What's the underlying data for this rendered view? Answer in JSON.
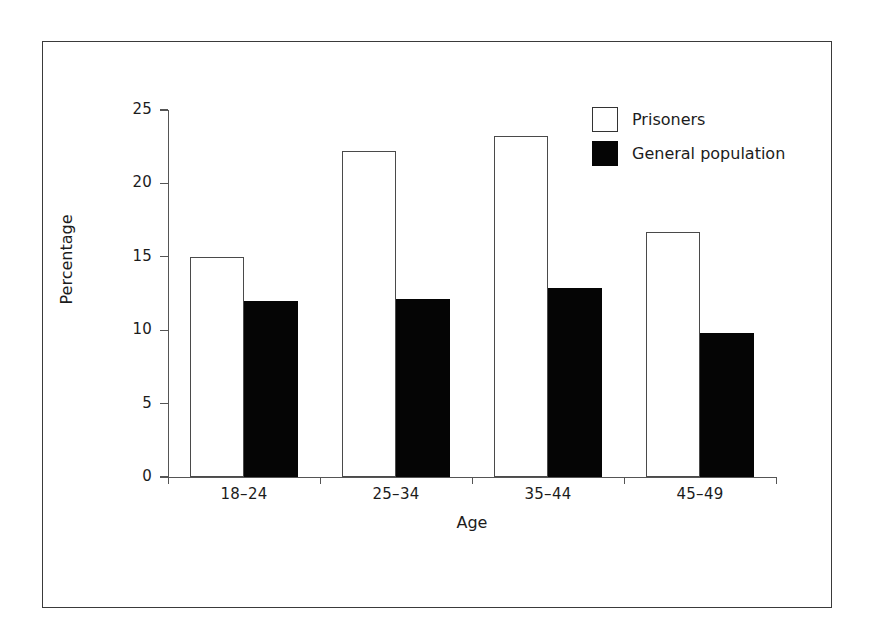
{
  "chart_data": {
    "type": "bar",
    "title": "",
    "subtitle": "",
    "xlabel": "Age",
    "ylabel": "Percentage",
    "categories": [
      "18–24",
      "25–34",
      "35–44",
      "45–49"
    ],
    "series": [
      {
        "name": "Prisoners",
        "values": [
          15.0,
          22.2,
          23.2,
          16.7
        ],
        "color": "#ffffff",
        "edge_color": "#4a4a4a"
      },
      {
        "name": "General population",
        "values": [
          12.0,
          12.1,
          12.9,
          9.8
        ],
        "color": "#050505",
        "edge_color": "#050505"
      }
    ],
    "ylim": [
      0,
      25
    ],
    "yticks": [
      0,
      5,
      10,
      15,
      20,
      25
    ],
    "ytick_labels": [
      "0",
      "5",
      "10",
      "15",
      "20",
      "25"
    ],
    "grid": false,
    "legend_position": "top-right",
    "orientation": "vertical",
    "bar_grouping": "grouped"
  },
  "axes": {
    "y_title": "Percentage",
    "x_title": "Age"
  },
  "legend": {
    "entries": [
      {
        "label": "Prisoners",
        "swatch": "white-square"
      },
      {
        "label": "General population",
        "swatch": "black-square"
      }
    ]
  },
  "colors": {
    "background": "#ffffff",
    "frame": "#3a3a3a",
    "axis": "#555555",
    "text": "#1c1c1c",
    "prisoners_fill": "#ffffff",
    "prisoners_edge": "#4a4a4a",
    "general_fill": "#050505"
  }
}
